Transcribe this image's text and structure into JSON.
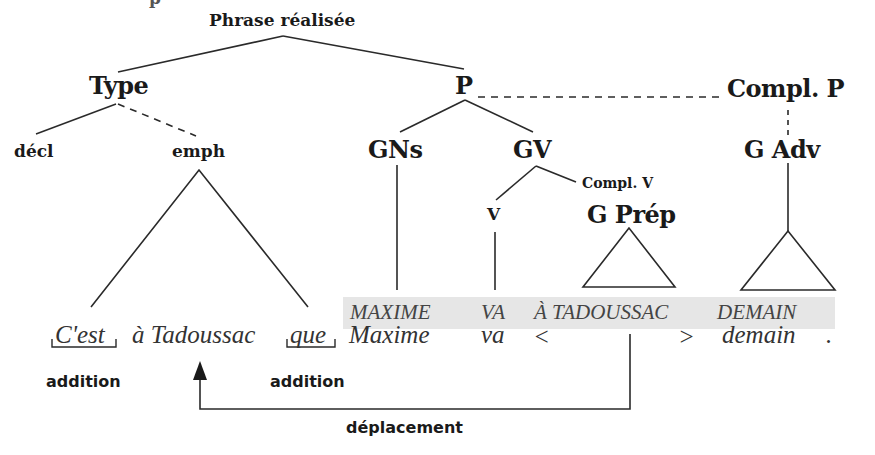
{
  "diagram": {
    "title_partial": "p",
    "root": "Phrase réalisée",
    "level1": {
      "type": "Type",
      "p": "P",
      "compl_p": "Compl. P"
    },
    "level2": {
      "decl": "décl",
      "emph": "emph",
      "gns": "GNs",
      "gv": "GV",
      "g_adv": "G Adv"
    },
    "level3": {
      "compl_v": "Compl. V",
      "v": "V",
      "g_prep": "G Prép"
    },
    "deep_structure": {
      "words": [
        "MAXIME",
        "VA",
        "À TADOUSSAC",
        "DEMAIN"
      ],
      "band_color": "#e6e6e6"
    },
    "surface_sentence": {
      "cest": "C'est",
      "a_tadoussac": "à Tadoussac",
      "que": "que",
      "maxime": "Maxime",
      "va": "va",
      "lt": "<",
      "gt": ">",
      "demain": "demain",
      "period": "."
    },
    "operations": {
      "addition_1": "addition",
      "addition_2": "addition",
      "deplacement": "déplacement"
    },
    "edges": {
      "solid": [
        "Phrase réalisée–Type",
        "Phrase réalisée–P",
        "Type–décl",
        "P–GNs",
        "P–GV",
        "GV–V",
        "GV–Compl. V"
      ],
      "dashed": [
        "Type–emph",
        "P–Compl. P",
        "Compl. P–G Adv"
      ]
    }
  }
}
